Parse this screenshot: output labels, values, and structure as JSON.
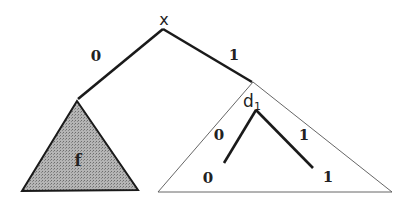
{
  "diagram": {
    "root": {
      "label": "x"
    },
    "edges": {
      "left_label": "0",
      "right_label": "1"
    },
    "left_subtree": {
      "label": "f",
      "fill": "#a8a8a8"
    },
    "right_subtree": {
      "node_label": "d",
      "node_subscript": "1",
      "left_edge_label": "0",
      "right_edge_label": "1",
      "left_leaf": "0",
      "right_leaf": "1"
    }
  }
}
